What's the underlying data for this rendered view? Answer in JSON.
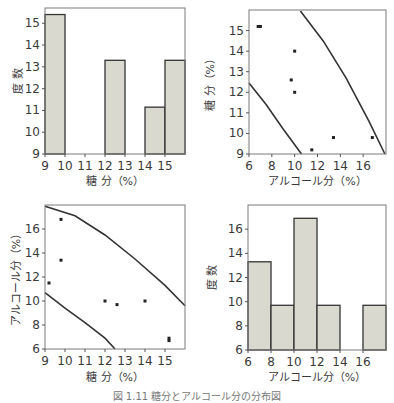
{
  "caption": "図 1.11 糖分とアルコール分の分布図",
  "chart_data": [
    {
      "type": "bar",
      "position": "top-left",
      "title": "",
      "xlabel": "糖 分（%）",
      "ylabel": "度 数",
      "xlim": [
        9,
        16
      ],
      "ylim": [
        9,
        15.7
      ],
      "xticks": [
        9,
        10,
        11,
        12,
        13,
        14,
        15
      ],
      "yticks": [
        9,
        10,
        11,
        12,
        13,
        14,
        15
      ],
      "bins": [
        [
          9,
          10
        ],
        [
          10,
          11
        ],
        [
          11,
          12
        ],
        [
          12,
          13
        ],
        [
          13,
          14
        ],
        [
          14,
          15
        ],
        [
          15,
          16
        ]
      ],
      "values": [
        15.4,
        9,
        9,
        13.3,
        9,
        11.15,
        13.3
      ],
      "grid": false
    },
    {
      "type": "scatter",
      "position": "top-right",
      "xlabel": "アルコール分（%）",
      "ylabel": "糖 分（%）",
      "xlim": [
        6,
        18
      ],
      "ylim": [
        9,
        16
      ],
      "xticks": [
        6,
        8,
        10,
        12,
        14,
        16
      ],
      "yticks": [
        9,
        10,
        11,
        12,
        13,
        14,
        15
      ],
      "points": [
        [
          6.8,
          15.2
        ],
        [
          7.0,
          15.2
        ],
        [
          10.0,
          14.0
        ],
        [
          9.7,
          12.6
        ],
        [
          10.0,
          12.0
        ],
        [
          11.5,
          9.2
        ],
        [
          13.4,
          9.8
        ],
        [
          16.8,
          9.8
        ]
      ],
      "curves": [
        {
          "name": "lower-bound",
          "points": [
            [
              6.0,
              12.45
            ],
            [
              7.5,
              11.4
            ],
            [
              9.0,
              10.2
            ],
            [
              10.6,
              9.0
            ]
          ]
        },
        {
          "name": "upper-bound",
          "points": [
            [
              10.5,
              15.95
            ],
            [
              12.5,
              14.5
            ],
            [
              14.5,
              12.7
            ],
            [
              16.5,
              10.6
            ],
            [
              17.9,
              9.0
            ]
          ]
        }
      ],
      "grid": false
    },
    {
      "type": "scatter",
      "position": "bottom-left",
      "xlabel": "糖 分（%）",
      "ylabel": "アルコール分（%）",
      "xlim": [
        9,
        16
      ],
      "ylim": [
        6,
        18
      ],
      "xticks": [
        9,
        10,
        11,
        12,
        13,
        14,
        15
      ],
      "yticks": [
        6,
        8,
        10,
        12,
        14,
        16
      ],
      "points": [
        [
          9.2,
          11.5
        ],
        [
          9.8,
          16.8
        ],
        [
          9.8,
          13.4
        ],
        [
          12.0,
          10.0
        ],
        [
          12.6,
          9.7
        ],
        [
          14.0,
          10.0
        ],
        [
          15.2,
          6.9
        ],
        [
          15.2,
          6.7
        ]
      ],
      "curves": [
        {
          "name": "upper-bound",
          "points": [
            [
              9.0,
              17.9
            ],
            [
              10.5,
              17.1
            ],
            [
              12.0,
              15.5
            ],
            [
              13.5,
              13.5
            ],
            [
              15.0,
              11.3
            ],
            [
              16.0,
              9.6
            ]
          ]
        },
        {
          "name": "lower-bound",
          "points": [
            [
              9.0,
              10.7
            ],
            [
              10.0,
              9.4
            ],
            [
              11.0,
              8.2
            ],
            [
              12.0,
              6.9
            ],
            [
              12.5,
              6.0
            ]
          ]
        }
      ],
      "grid": false
    },
    {
      "type": "bar",
      "position": "bottom-right",
      "xlabel": "アルコール分（%）",
      "ylabel": "度 数",
      "xlim": [
        6,
        18
      ],
      "ylim": [
        6,
        18
      ],
      "xticks": [
        6,
        8,
        10,
        12,
        14,
        16
      ],
      "yticks": [
        6,
        8,
        10,
        12,
        14,
        16
      ],
      "bins": [
        [
          6,
          8
        ],
        [
          8,
          10
        ],
        [
          10,
          12
        ],
        [
          12,
          14
        ],
        [
          14,
          16
        ],
        [
          16,
          18
        ]
      ],
      "values": [
        13.3,
        9.7,
        16.9,
        9.7,
        6,
        9.7
      ],
      "grid": false
    }
  ]
}
